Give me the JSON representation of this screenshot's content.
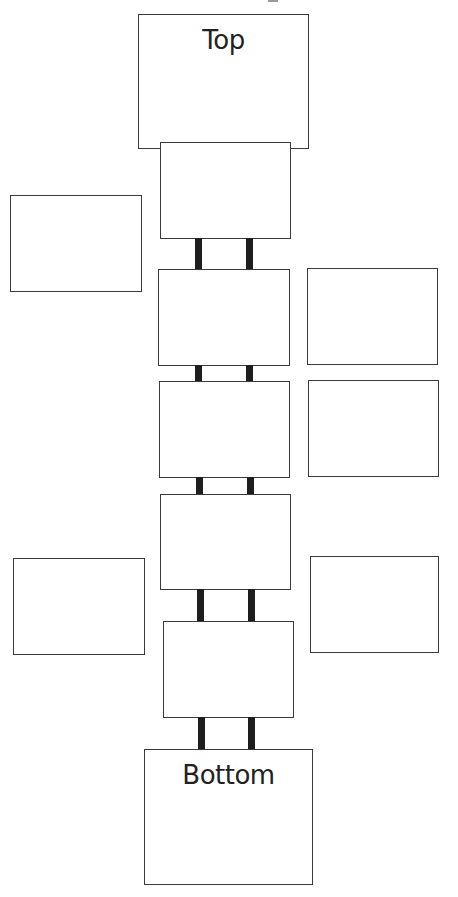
{
  "diagram": {
    "top_label": "Top",
    "bottom_label": "Bottom",
    "colors": {
      "stroke": "#3a3a3a",
      "connector": "#1e1e1e",
      "text": "#222222",
      "background": "#ffffff"
    },
    "spine_boxes": 5,
    "side_boxes": {
      "left": 2,
      "right": 3
    }
  }
}
